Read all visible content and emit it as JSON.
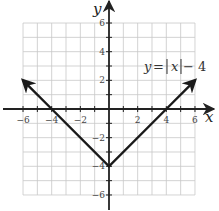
{
  "chart_data": {
    "type": "line",
    "title": "",
    "function": "y = |x| - 4",
    "annotation": "y = |x| − 4",
    "xlabel": "x",
    "ylabel": "y",
    "xlim": [
      -6,
      6
    ],
    "ylim": [
      -6,
      6
    ],
    "grid": true,
    "grid_step": 1,
    "x_tick_labels": [
      "-6",
      "-4",
      "-2",
      "2",
      "4",
      "6"
    ],
    "y_tick_labels": [
      "6",
      "4",
      "2",
      "-2",
      "-4",
      "-6"
    ],
    "series": [
      {
        "name": "y = |x| - 4",
        "x": [
          -6,
          -4,
          0,
          4,
          6
        ],
        "y": [
          2,
          0,
          -4,
          0,
          2
        ],
        "arrows_at_ends": true
      }
    ]
  },
  "labels": {
    "x_axis": "x",
    "y_axis": "y",
    "equation_y": "y",
    "equation_eq": "=",
    "equation_x": "x",
    "equation_tail": "− 4"
  },
  "ticks": {
    "x": [
      {
        "value": -6,
        "label": "−6"
      },
      {
        "value": -4,
        "label": "−4"
      },
      {
        "value": -2,
        "label": "−2"
      },
      {
        "value": 2,
        "label": "2"
      },
      {
        "value": 4,
        "label": "4"
      },
      {
        "value": 6,
        "label": "6"
      }
    ],
    "y": [
      {
        "value": 6,
        "label": "6"
      },
      {
        "value": 4,
        "label": "4"
      },
      {
        "value": 2,
        "label": "2"
      },
      {
        "value": -2,
        "label": "−2"
      },
      {
        "value": -4,
        "label": "−4"
      },
      {
        "value": -6,
        "label": "−6"
      }
    ]
  },
  "colors": {
    "grid": "#c8c8c8",
    "axis": "#222222",
    "curve": "#1a1a1a",
    "text": "#444444"
  }
}
